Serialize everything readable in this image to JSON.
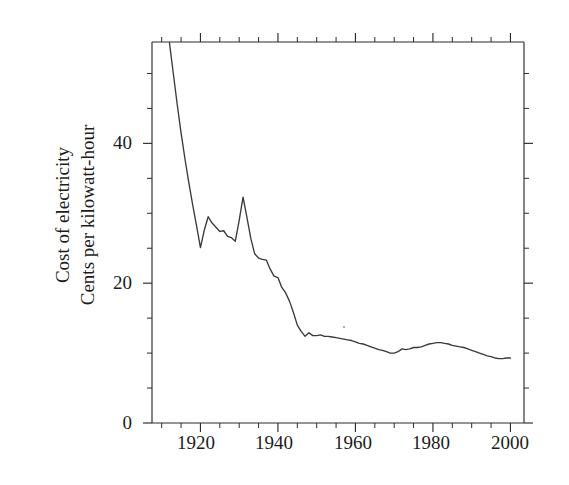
{
  "figure": {
    "background_color": "#ffffff",
    "line_color": "#3a3a3a",
    "axis_color": "#2b2b2b"
  },
  "axis_titles": {
    "y_line1": "Cost of electricity",
    "y_line2": "Cents per kilowatt-hour",
    "x": ""
  },
  "ticks": {
    "y_major_labels": [
      "0",
      "20",
      "40"
    ],
    "x_major_labels": [
      "1920",
      "1940",
      "1960",
      "1980",
      "2000"
    ]
  },
  "chart_data": {
    "type": "line",
    "title": "",
    "subtitle": "",
    "xlabel": "",
    "ylabel": "Cost of electricity\nCents per kilowatt-hour",
    "xlim": [
      1907.5,
      2003.5
    ],
    "ylim": [
      0,
      54.5
    ],
    "xticks_major": [
      1920,
      1940,
      1960,
      1980,
      2000
    ],
    "xticks_minor_step": 5,
    "yticks_major": [
      0,
      20,
      40
    ],
    "yticks_minor_step": 5,
    "grid": false,
    "legend": null,
    "legend_position": "none",
    "series": [
      {
        "name": "Cost of electricity",
        "units": "cents per kilowatt-hour",
        "x": [
          1912,
          1913,
          1914,
          1915,
          1916,
          1917,
          1918,
          1919,
          1920,
          1921,
          1922,
          1923,
          1924,
          1925,
          1926,
          1927,
          1928,
          1929,
          1930,
          1931,
          1932,
          1933,
          1934,
          1935,
          1936,
          1937,
          1938,
          1939,
          1940,
          1941,
          1942,
          1943,
          1944,
          1945,
          1946,
          1947,
          1948,
          1949,
          1950,
          1951,
          1952,
          1953,
          1954,
          1955,
          1956,
          1957,
          1958,
          1959,
          1960,
          1961,
          1962,
          1963,
          1964,
          1965,
          1966,
          1967,
          1968,
          1969,
          1970,
          1971,
          1972,
          1973,
          1974,
          1975,
          1976,
          1977,
          1978,
          1979,
          1980,
          1981,
          1982,
          1983,
          1984,
          1985,
          1986,
          1987,
          1988,
          1989,
          1990,
          1991,
          1992,
          1993,
          1994,
          1995,
          1996,
          1997,
          1998,
          1999,
          2000
        ],
        "y": [
          54.4,
          50.0,
          45.6,
          41.5,
          37.8,
          34.4,
          31.2,
          28.2,
          25.1,
          27.6,
          29.5,
          28.6,
          28.0,
          27.4,
          27.5,
          26.7,
          26.5,
          26.0,
          29.0,
          32.3,
          29.4,
          26.4,
          24.2,
          23.6,
          23.4,
          23.3,
          22.0,
          21.0,
          20.8,
          19.4,
          18.6,
          17.4,
          15.8,
          14.0,
          13.1,
          12.4,
          12.9,
          12.5,
          12.5,
          12.6,
          12.4,
          12.4,
          12.3,
          12.2,
          12.1,
          12.0,
          11.9,
          11.8,
          11.6,
          11.4,
          11.3,
          11.1,
          10.9,
          10.7,
          10.5,
          10.4,
          10.2,
          10.0,
          10.0,
          10.2,
          10.6,
          10.5,
          10.6,
          10.8,
          10.8,
          10.9,
          11.1,
          11.3,
          11.4,
          11.5,
          11.5,
          11.4,
          11.3,
          11.1,
          11.0,
          10.9,
          10.8,
          10.6,
          10.4,
          10.2,
          10.0,
          9.8,
          9.6,
          9.5,
          9.3,
          9.2,
          9.2,
          9.3,
          9.3
        ]
      }
    ]
  },
  "plot_geometry": {
    "left_px": 152,
    "right_px": 524,
    "top_px": 42,
    "bottom_px": 423
  }
}
